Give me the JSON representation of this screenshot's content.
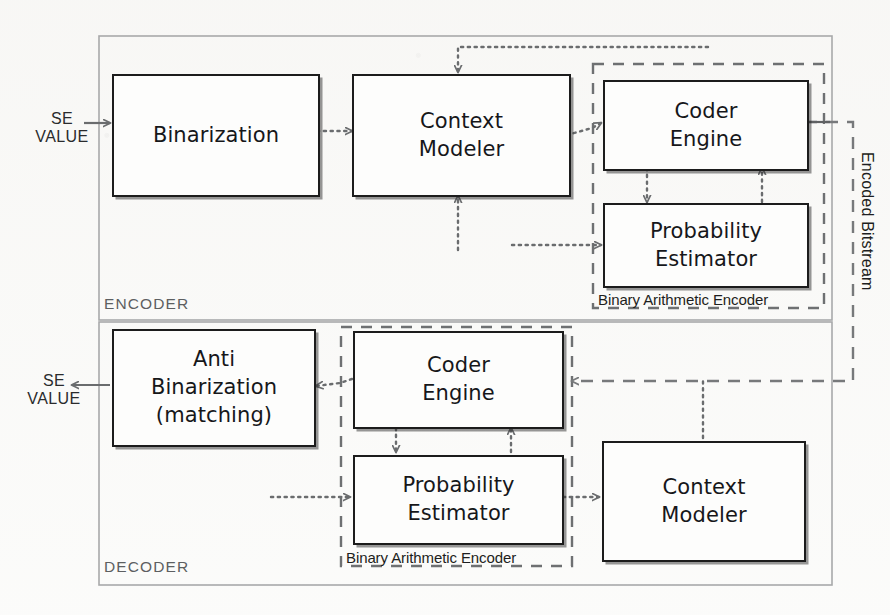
{
  "diagram": {
    "sections": [
      {
        "id": "encoder",
        "label": "ENCODER"
      },
      {
        "id": "decoder",
        "label": "DECODER"
      }
    ],
    "group_labels": {
      "encoder_bae": "Binary Arithmetic Encoder",
      "decoder_bae": "Binary Arithmetic Encoder"
    },
    "io_labels": {
      "encoder_input_line1": "SE",
      "encoder_input_line2": "VALUE",
      "decoder_output_line1": "SE",
      "decoder_output_line2": "VALUE",
      "bitstream": "Encoded Bitstream"
    },
    "blocks": [
      {
        "id": "enc-binarization",
        "section": "encoder",
        "lines": [
          "Binarization"
        ]
      },
      {
        "id": "enc-context-modeler",
        "section": "encoder",
        "lines": [
          "Context",
          "Modeler"
        ]
      },
      {
        "id": "enc-coder-engine",
        "section": "encoder",
        "lines": [
          "Coder",
          "Engine"
        ]
      },
      {
        "id": "enc-probability-estimator",
        "section": "encoder",
        "lines": [
          "Probability",
          "Estimator"
        ]
      },
      {
        "id": "dec-anti-binarization",
        "section": "decoder",
        "lines": [
          "Anti",
          "Binarization",
          "(matching)"
        ]
      },
      {
        "id": "dec-coder-engine",
        "section": "decoder",
        "lines": [
          "Coder",
          "Engine"
        ]
      },
      {
        "id": "dec-probability-estimator",
        "section": "decoder",
        "lines": [
          "Probability",
          "Estimator"
        ]
      },
      {
        "id": "dec-context-modeler",
        "section": "decoder",
        "lines": [
          "Context",
          "Modeler"
        ]
      }
    ],
    "colors": {
      "block_border": "#1c1c1c",
      "block_fill": "#fdfdfc",
      "section_border": "#a8a9aa",
      "group_dashed_border": "#6e7072",
      "connector": "#6a6c6e",
      "text": "#16171a",
      "background": "#fbfbfa"
    }
  }
}
